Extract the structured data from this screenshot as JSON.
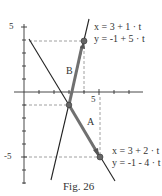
{
  "figure": {
    "caption": "Fig. 26",
    "axes": {
      "y_tick_top_label": "5",
      "y_tick_bottom_label": "-5",
      "x_tick_label": "5"
    },
    "vectors": {
      "A": {
        "label": "A",
        "eq_x": "x = 3 + 2 · t",
        "eq_y": "y = -1 - 4 · t",
        "start": [
          3,
          -1
        ],
        "end": [
          5,
          -5
        ]
      },
      "B": {
        "label": "B",
        "eq_x": "x = 3 + 1 · t",
        "eq_y": "y = -1 + 5 · t",
        "start": [
          3,
          -1
        ],
        "end": [
          4,
          4
        ]
      }
    },
    "colors": {
      "line": "#222222",
      "vector": "#707070",
      "dashed": "#888888",
      "point": "#666666"
    }
  }
}
